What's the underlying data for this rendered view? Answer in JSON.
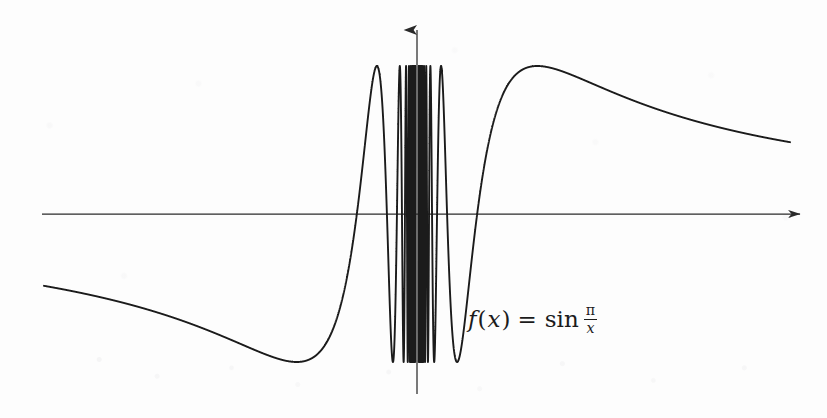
{
  "figure": {
    "kind": "mathematical-function-plot",
    "background_color": "#fdfdfd",
    "ink_color": "#1b1b1b",
    "axis_color": "#2a2a2a"
  },
  "annotation": {
    "fn_name": "f",
    "open_paren": "(",
    "arg": "x",
    "close_paren": ")",
    "equals": "=",
    "sin_label": "sin",
    "fraction_numerator": "π",
    "fraction_denominator": "x",
    "full_text": "f(x) = sin π/x"
  },
  "axes": {
    "x_axis": {
      "name": "x-axis",
      "y_pixel": 214,
      "x_start_pixel": 42,
      "x_end_pixel": 806,
      "arrow": "right",
      "tick_labels": [],
      "label": ""
    },
    "y_axis": {
      "name": "y-axis",
      "x_pixel": 417,
      "y_top_pixel": 22,
      "y_bottom_pixel": 394,
      "arrow": "up",
      "tick_labels": [],
      "label": ""
    }
  },
  "chart_data": {
    "type": "line",
    "title": "",
    "subtitle": "",
    "xlabel": "",
    "ylabel": "",
    "annotations": [
      "f(x) = sin π/x"
    ],
    "legend": [],
    "legend_position": "none",
    "grid": false,
    "function": "sin(pi/x)",
    "xlim": [
      -6.2,
      6.2
    ],
    "ylim": [
      -1.28,
      1.28
    ],
    "series": [
      {
        "name": "f(x) = sin(pi/x)",
        "color": "#1b1b1b",
        "line_width": 1.9,
        "samples_note": "curve evaluated analytically from the function expression"
      }
    ],
    "features": {
      "left_tail_start": {
        "x": -6.2,
        "y": -0.16
      },
      "global_minimum_visible": {
        "x": -0.67,
        "y": -1.0
      },
      "global_maximum_visible": {
        "x": 0.67,
        "y": 1.0
      },
      "right_tail_end": {
        "x": 6.2,
        "y": 0.16
      },
      "oscillation_band_x": [
        -0.4,
        0.4
      ],
      "oscillation_amplitude": 1.0,
      "essential_discontinuity_at": 0
    },
    "x_axis_crossings": [
      -1,
      -0.5,
      -0.3333,
      -0.25,
      -0.2,
      0.2,
      0.25,
      0.3333,
      0.5,
      1
    ]
  }
}
